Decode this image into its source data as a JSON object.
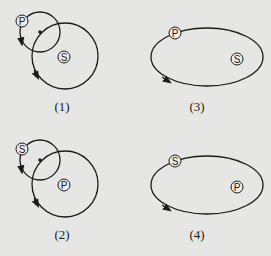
{
  "colors": {
    "background": "#e6e6e4",
    "stroke": "#1a1a1a",
    "marker_fill": "#ececea"
  },
  "panels": [
    {
      "id": "1",
      "caption": "(1)",
      "type": "two-circles",
      "small_circle_label": "P",
      "large_circle_label": "S",
      "offset": [
        0,
        0
      ],
      "caption_pos": [
        42,
        100
      ]
    },
    {
      "id": "2",
      "caption": "(2)",
      "type": "two-circles",
      "small_circle_label": "S",
      "large_circle_label": "P",
      "offset": [
        0,
        128
      ],
      "caption_pos": [
        42,
        228
      ]
    },
    {
      "id": "3",
      "caption": "(3)",
      "type": "ellipse",
      "orbit_label": "P",
      "focus_label": "S",
      "offset": [
        135,
        0
      ],
      "caption_pos": [
        177,
        100
      ]
    },
    {
      "id": "4",
      "caption": "(4)",
      "type": "ellipse",
      "orbit_label": "S",
      "focus_label": "P",
      "offset": [
        135,
        128
      ],
      "caption_pos": [
        177,
        228
      ]
    }
  ]
}
